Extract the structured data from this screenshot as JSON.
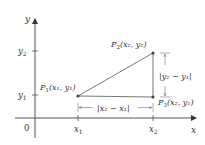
{
  "diagram": {
    "axes": {
      "x_label": "x",
      "y_label": "y",
      "origin_label": "0"
    },
    "ticks": {
      "x": [
        {
          "label": "x",
          "sub": "1"
        },
        {
          "label": "x",
          "sub": "2"
        }
      ],
      "y": [
        {
          "label": "y",
          "sub": "2"
        },
        {
          "label": "y",
          "sub": "1"
        }
      ]
    },
    "points": {
      "p1": {
        "name": "P",
        "sub": "1",
        "coords": "(x₁, y₁)"
      },
      "p2": {
        "name": "P",
        "sub": "2",
        "coords": "(x₂, y₂)"
      },
      "p3": {
        "name": "P",
        "sub": "3",
        "coords": "(x₂, y₁)"
      }
    },
    "dimensions": {
      "horizontal": "|x₂ − x₁|",
      "vertical": "|y₂ − y₁|"
    },
    "colors": {
      "line": "#555555",
      "point": "#444444",
      "text": "#333333"
    }
  }
}
